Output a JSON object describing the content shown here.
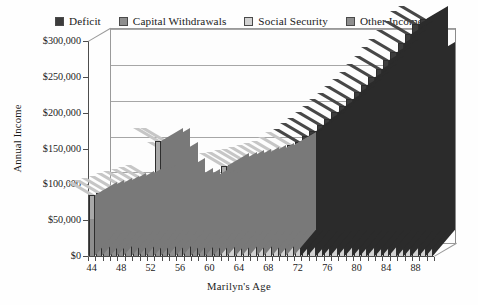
{
  "legend": {
    "items": [
      {
        "label": "Deficit",
        "color": "#3c3c3c",
        "key": "deficit"
      },
      {
        "label": "Capital Withdrawals",
        "color": "#8e8e8e",
        "key": "capital_withdrawals"
      },
      {
        "label": "Social Security",
        "color": "#d2d2d2",
        "key": "social_security"
      },
      {
        "label": "Other Income",
        "color": "#8e8e8e",
        "key": "other_income"
      }
    ]
  },
  "axes": {
    "ylabel": "Annual Income",
    "xlabel": "Marilyn's Age",
    "yticks": [
      "$0",
      "$50,000",
      "$100,000",
      "$150,000",
      "$200,000",
      "$250,000",
      "$300,000"
    ],
    "xticks": [
      "44",
      "48",
      "52",
      "56",
      "60",
      "64",
      "68",
      "72",
      "76",
      "80",
      "84",
      "88"
    ]
  },
  "chart_data": {
    "type": "bar",
    "title": "",
    "subtitle": "",
    "xlabel": "Marilyn's Age",
    "ylabel": "Annual Income",
    "stacked": true,
    "grid": true,
    "legend_position": "top",
    "ylim": [
      0,
      300000
    ],
    "ytick_values": [
      0,
      50000,
      100000,
      150000,
      200000,
      250000,
      300000
    ],
    "xlim": [
      43.5,
      90.5
    ],
    "categories": [
      44,
      45,
      46,
      47,
      48,
      49,
      50,
      51,
      52,
      53,
      54,
      55,
      56,
      57,
      58,
      59,
      60,
      61,
      62,
      63,
      64,
      65,
      66,
      67,
      68,
      69,
      70,
      71,
      72,
      73,
      74,
      75,
      76,
      77,
      78,
      79,
      80,
      81,
      82,
      83,
      84,
      85,
      86,
      87,
      88,
      89,
      90
    ],
    "series": [
      {
        "name": "Social Security",
        "color": "#d2d2d2",
        "values": [
          0,
          0,
          0,
          0,
          0,
          0,
          0,
          0,
          0,
          0,
          0,
          0,
          0,
          0,
          0,
          0,
          0,
          0,
          24000,
          24600,
          25300,
          26000,
          26700,
          27400,
          28100,
          28800,
          29500,
          30300,
          31100,
          31900,
          32700,
          33500,
          34400,
          35300,
          36200,
          37100,
          38000,
          39000,
          40000,
          41000,
          42100,
          43200,
          44300,
          45400,
          46600,
          47800,
          49000
        ]
      },
      {
        "name": "Other Income",
        "color": "#8e8e8e",
        "values": [
          52000,
          53500,
          55000,
          56500,
          58000,
          59500,
          61000,
          62500,
          64000,
          65500,
          67000,
          68500,
          70000,
          71500,
          73000,
          74500,
          76000,
          66000,
          56000,
          46000,
          36000,
          26000,
          16000,
          8000,
          4000,
          2000,
          1000,
          0,
          0,
          0,
          0,
          0,
          0,
          0,
          0,
          0,
          0,
          0,
          0,
          0,
          0,
          0,
          0,
          0,
          0,
          0,
          0
        ]
      },
      {
        "name": "Capital Withdrawals",
        "color": "#a8a8a8",
        "values": [
          33000,
          34500,
          36000,
          37500,
          39000,
          40500,
          42000,
          43500,
          45000,
          95000,
          93000,
          72000,
          48000,
          33000,
          30000,
          28000,
          26000,
          36000,
          46000,
          57000,
          68000,
          79000,
          91000,
          101000,
          107000,
          112000,
          117000,
          124000,
          15000,
          15000,
          15000,
          15000,
          15000,
          15000,
          15000,
          15000,
          15000,
          15000,
          15000,
          15000,
          15000,
          15000,
          15000,
          15000,
          15000,
          15000,
          15000
        ]
      },
      {
        "name": "Deficit",
        "color": "#3c3c3c",
        "values": [
          0,
          0,
          0,
          0,
          0,
          0,
          0,
          0,
          0,
          0,
          0,
          0,
          0,
          0,
          0,
          0,
          0,
          0,
          0,
          0,
          0,
          0,
          0,
          0,
          0,
          0,
          0,
          0,
          113000,
          120000,
          127000,
          134000,
          142000,
          150000,
          158000,
          167000,
          176000,
          185000,
          195000,
          205000,
          216000,
          227000,
          238000,
          250000,
          262000,
          268000,
          216000
        ]
      }
    ],
    "totals": [
      85000,
      88000,
      91000,
      94000,
      97000,
      100000,
      103000,
      106000,
      109000,
      160500,
      160000,
      140500,
      118000,
      104500,
      103000,
      102500,
      102000,
      102000,
      126000,
      127600,
      129300,
      131000,
      133700,
      136400,
      139100,
      142800,
      147500,
      154300,
      159100,
      166900,
      174700,
      182500,
      191400,
      200300,
      209200,
      219100,
      229000,
      239000,
      250000,
      261000,
      273100,
      285200,
      297300,
      310400,
      323600,
      330800,
      280000
    ]
  }
}
